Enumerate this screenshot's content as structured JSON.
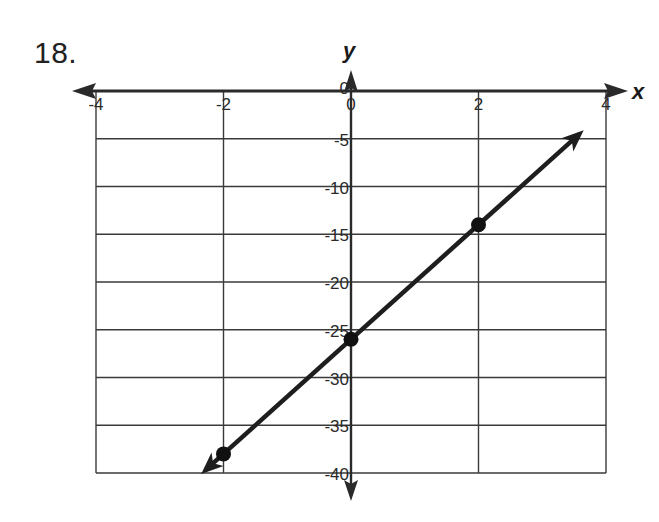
{
  "problem": {
    "number": "18."
  },
  "colors": {
    "axis": "#2a2a2a",
    "grid": "#3a3a3a",
    "line": "#1e1e1e",
    "point": "#111111",
    "text": "#2a2a2a"
  },
  "chart_data": {
    "type": "line",
    "title": "",
    "xlabel": "x",
    "ylabel": "y",
    "xlim": [
      -4,
      4
    ],
    "ylim": [
      -40,
      0
    ],
    "x_ticks": [
      -4,
      -2,
      0,
      2,
      4
    ],
    "x_tick_labels": [
      "-4",
      "-2",
      "0",
      "2",
      "4"
    ],
    "y_ticks": [
      0,
      -5,
      -10,
      -15,
      -20,
      -25,
      -30,
      -35,
      -40
    ],
    "y_tick_labels": [
      "0",
      "-5",
      "-10",
      "-15",
      "-20",
      "-25",
      "-30",
      "-35",
      "-40"
    ],
    "grid": true,
    "series": [
      {
        "name": "line",
        "equation": "y = 6x - 26",
        "x": [
          -2,
          0,
          2
        ],
        "y": [
          -38,
          -26,
          -14
        ],
        "marked_points": [
          [
            -2,
            -38
          ],
          [
            0,
            -26
          ],
          [
            2,
            -14
          ]
        ],
        "arrows_both_ends": true
      }
    ]
  }
}
